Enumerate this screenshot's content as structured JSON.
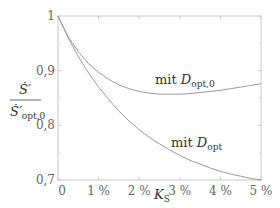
{
  "chart_data": {
    "type": "line",
    "title": "",
    "xlabel": "K_S",
    "ylabel": "Ṡ' / Ṡ'_opt,0",
    "ylabel_parts": {
      "numerator": "Ṡ′",
      "denominator": "Ṡ′",
      "denominator_sub": "opt,0"
    },
    "xlabel_parts": {
      "main": "K",
      "sub": "S"
    },
    "xlim": [
      0,
      5
    ],
    "ylim": [
      0.7,
      1.0
    ],
    "x_unit": "%",
    "x_ticks": [
      0,
      1,
      2,
      3,
      4,
      5
    ],
    "x_tick_labels": [
      "0",
      "1 %",
      "2 %",
      "3 %",
      "4 %",
      "5 %"
    ],
    "y_ticks": [
      0.7,
      0.8,
      0.9,
      1.0
    ],
    "y_tick_labels": [
      "0,7",
      "0,8",
      "0,9",
      "1"
    ],
    "grid": false,
    "legend": null,
    "series": [
      {
        "name": "mit D_opt,0",
        "label_main": "mit ",
        "label_var": "D",
        "label_sub": "opt,0",
        "color": "#9a9a9a",
        "x": [
          0,
          0.25,
          0.5,
          0.75,
          1.0,
          1.25,
          1.5,
          1.75,
          2.0,
          2.25,
          2.5,
          2.75,
          3.0,
          3.25,
          3.5,
          3.75,
          4.0,
          4.25,
          4.5,
          4.75,
          5.0
        ],
        "y": [
          1.0,
          0.962,
          0.935,
          0.913,
          0.897,
          0.884,
          0.874,
          0.867,
          0.862,
          0.859,
          0.857,
          0.857,
          0.857,
          0.858,
          0.86,
          0.862,
          0.864,
          0.867,
          0.87,
          0.873,
          0.876
        ]
      },
      {
        "name": "mit D_opt",
        "label_main": "mit ",
        "label_var": "D",
        "label_sub": "opt",
        "color": "#9a9a9a",
        "x": [
          0,
          0.25,
          0.5,
          0.75,
          1.0,
          1.25,
          1.5,
          1.75,
          2.0,
          2.25,
          2.5,
          2.75,
          3.0,
          3.25,
          3.5,
          3.75,
          4.0,
          4.25,
          4.5,
          4.75,
          5.0
        ],
        "y": [
          1.0,
          0.96,
          0.926,
          0.896,
          0.87,
          0.847,
          0.826,
          0.808,
          0.792,
          0.778,
          0.766,
          0.755,
          0.745,
          0.736,
          0.729,
          0.722,
          0.716,
          0.711,
          0.707,
          0.703,
          0.7
        ]
      }
    ],
    "annotations": [
      {
        "series": 0,
        "x_px": 155,
        "y_px": 84
      },
      {
        "series": 1,
        "x_px": 171,
        "y_px": 147
      }
    ]
  }
}
